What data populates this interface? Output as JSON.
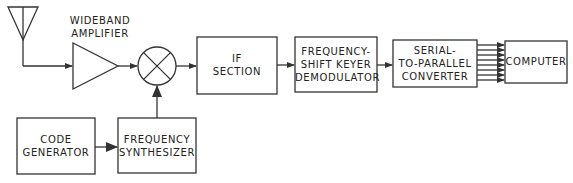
{
  "diagram": {
    "type": "block-diagram",
    "title": "",
    "blocks": {
      "antenna": {
        "label": ""
      },
      "amplifier": {
        "label_line1": "WIDEBAND",
        "label_line2": "AMPLIFIER"
      },
      "mixer": {
        "label": ""
      },
      "if_section": {
        "line1": "IF",
        "line2": "SECTION"
      },
      "fsk_demod": {
        "line1": "FREQUENCY-",
        "line2": "SHIFT KEYER",
        "line3": "DEMODULATOR"
      },
      "s2p": {
        "line1": "SERIAL-",
        "line2": "TO-PARALLEL",
        "line3": "CONVERTER"
      },
      "computer": {
        "line1": "COMPUTER"
      },
      "code_gen": {
        "line1": "CODE",
        "line2": "GENERATOR"
      },
      "freq_synth": {
        "line1": "FREQUENCY",
        "line2": "SYNTHESIZER"
      }
    },
    "connections": [
      {
        "from": "antenna",
        "to": "amplifier"
      },
      {
        "from": "amplifier",
        "to": "mixer"
      },
      {
        "from": "freq_synth",
        "to": "mixer"
      },
      {
        "from": "mixer",
        "to": "if_section"
      },
      {
        "from": "if_section",
        "to": "fsk_demod"
      },
      {
        "from": "fsk_demod",
        "to": "s2p"
      },
      {
        "from": "s2p",
        "to": "computer",
        "parallel_lines": 8
      },
      {
        "from": "code_gen",
        "to": "freq_synth"
      }
    ],
    "colors": {
      "stroke": "#333333",
      "background": "#ffffff"
    }
  }
}
